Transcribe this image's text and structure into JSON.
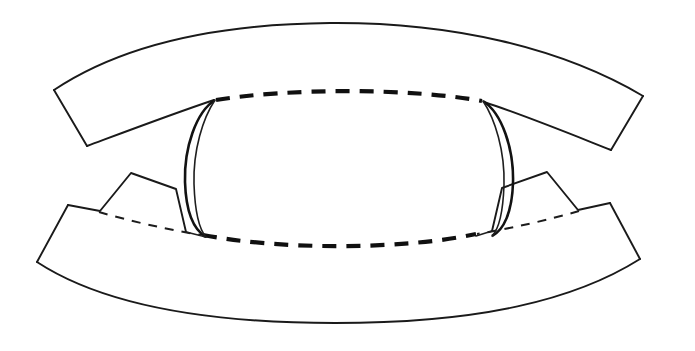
{
  "figure": {
    "background_color": "#ffffff",
    "ink_color": "#1a1a1a",
    "width": 695,
    "height": 351,
    "style": "black-and-white technical line art, scanned",
    "parts": [
      {
        "name": "upper-band",
        "description": "Wide crescent band arcing across the top, tapering to angled cut ends at left and right"
      },
      {
        "name": "lower-band",
        "description": "Wide crescent band arcing across the bottom, with stepped notch tabs near each inner end"
      },
      {
        "name": "left-sliver",
        "description": "Thin vertical crescent sliver at the left of the central opening"
      },
      {
        "name": "right-sliver",
        "description": "Thin vertical crescent sliver at the right of the central opening"
      },
      {
        "name": "central-opening",
        "description": "Rounded opening bounded above and below by heavy dashed arcs"
      }
    ],
    "line_styles": {
      "solid": "visible contour edges",
      "heavy_dashed": "hidden or far-side boundary of the central opening",
      "light_dashed": "hidden fold line running across each lower band tab"
    }
  }
}
